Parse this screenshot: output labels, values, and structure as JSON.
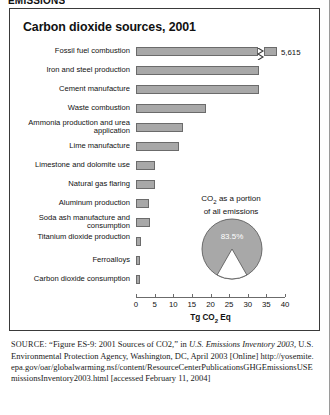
{
  "running_head": "EMISSIONS",
  "figure": {
    "title": "Carbon dioxide sources, 2001",
    "axis_title_html": "Tg CO2 Eq",
    "axis_title_main": "Tg CO",
    "axis_title_sub": "2",
    "axis_title_tail": " Eq",
    "first_bar_value_label": "5,615"
  },
  "pie_panel": {
    "caption_line1_main": "CO",
    "caption_line1_sub": "2",
    "caption_line1_tail": " as a portion",
    "caption_line2": "of all emissions",
    "slice_label": "83.5%"
  },
  "source": {
    "label": "SOURCE:",
    "text_part1": " “Figure ES-9: 2001 Sources of CO2,” in ",
    "italic1": "U.S. Emissions",
    "italic2": "Inventory 2003,",
    "text_part2": " U.S. Environmental Protection Agency, Washington, DC, April 2003 [Online] ",
    "url": "http://yosemite.epa.gov/oar/globalwarming.nsf/content/ResourceCenterPublicationsGHGEmissionsUSEmissionsInventory2003.html",
    "text_part3": " [accessed February 11, 2004]"
  },
  "chart_data": {
    "type": "bar",
    "orientation": "horizontal",
    "title": "Carbon dioxide sources, 2001",
    "xlabel": "Tg CO2 Eq",
    "ylabel": "",
    "xlim": [
      0,
      40
    ],
    "xticks": [
      0,
      5,
      10,
      15,
      20,
      25,
      30,
      35,
      40
    ],
    "xtick_labels": [
      "0",
      "5",
      "10",
      "15",
      "20",
      "25",
      "30",
      "35",
      "40"
    ],
    "grid": false,
    "legend": false,
    "bar_color": "#a8a8a8",
    "note": "Top bar is axis-broken; its true value is 5,615 Tg CO2 Eq.",
    "categories": [
      "Fossil fuel combustion",
      "Iron and steel production",
      "Cement manufacture",
      "Waste combustion",
      "Ammonia production and urea application",
      "Lime manufacture",
      "Limestone and dolomite use",
      "Natural gas flaring",
      "Aluminum production",
      "Soda ash manufacture and consumption",
      "Titanium dioxide production",
      "Ferroalloys",
      "Carbon dioxide consumption"
    ],
    "values": [
      5615,
      33.0,
      33.0,
      18.8,
      12.7,
      11.5,
      5.2,
      5.1,
      3.5,
      3.7,
      1.3,
      1.2,
      1.2
    ],
    "plotted_lengths": [
      42.0,
      33.0,
      33.0,
      18.8,
      12.7,
      11.5,
      5.2,
      5.1,
      3.5,
      3.7,
      1.3,
      1.2,
      1.2
    ],
    "value_labels": [
      "5,615",
      "",
      "",
      "",
      "",
      "",
      "",
      "",
      "",
      "",
      "",
      "",
      ""
    ],
    "secondary_chart": {
      "type": "pie",
      "title": "CO2 as a portion of all emissions",
      "labels": [
        "CO2",
        "Other greenhouse gases"
      ],
      "values": [
        83.5,
        16.5
      ],
      "value_labels": [
        "83.5%",
        ""
      ],
      "colors": [
        "#a8a8a8",
        "#ffffff"
      ]
    }
  }
}
